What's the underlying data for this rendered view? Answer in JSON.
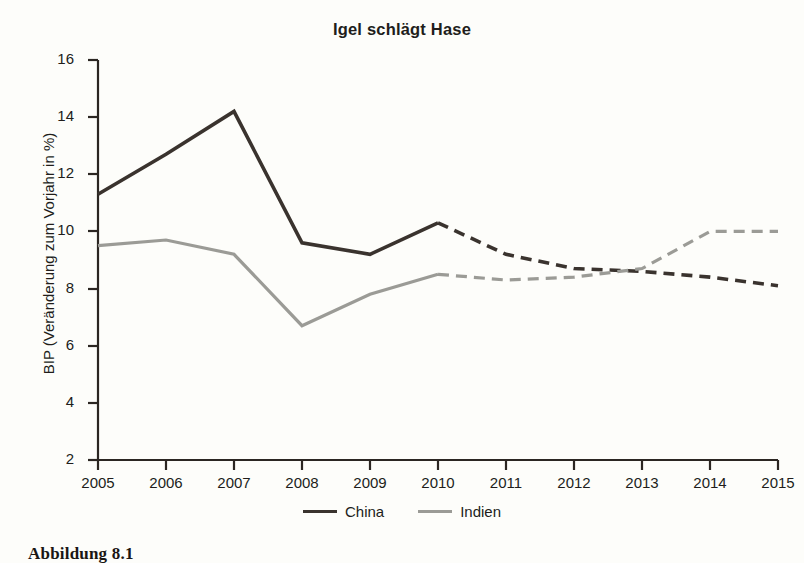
{
  "chart_data": {
    "type": "line",
    "title": "Igel schlägt Hase",
    "xlabel": "",
    "ylabel": "BIP (Veränderung zum Vorjahr in %)",
    "x": [
      2005,
      2006,
      2007,
      2008,
      2009,
      2010,
      2011,
      2012,
      2013,
      2014,
      2015
    ],
    "categories": [
      "2005",
      "2006",
      "2007",
      "2008",
      "2009",
      "2010",
      "2011",
      "2012",
      "2013",
      "2014",
      "2015"
    ],
    "xlim": [
      2005,
      2015
    ],
    "ylim": [
      2,
      16
    ],
    "yticks": [
      2,
      4,
      6,
      8,
      10,
      12,
      14,
      16
    ],
    "ytick_labels": [
      "2",
      "4",
      "6",
      "8",
      "10",
      "12",
      "14",
      "16"
    ],
    "grid": false,
    "legend_position": "bottom-center",
    "forecast_starts_at": 2010,
    "series": [
      {
        "name": "China",
        "color": "#3a332e",
        "values": [
          11.3,
          12.7,
          14.2,
          9.6,
          9.2,
          10.3,
          9.2,
          8.7,
          8.6,
          8.4,
          8.1
        ],
        "solid_until": 2010
      },
      {
        "name": "Indien",
        "color": "#9b9b96",
        "values": [
          9.5,
          9.7,
          9.2,
          6.7,
          7.8,
          8.5,
          8.3,
          8.4,
          8.7,
          10.0,
          10.0
        ],
        "solid_until": 2010
      }
    ]
  },
  "legend": {
    "entries": [
      {
        "label": "China",
        "color": "#3a332e"
      },
      {
        "label": "Indien",
        "color": "#9b9b96"
      }
    ]
  },
  "caption": {
    "text": "Abbildung 8.1"
  }
}
